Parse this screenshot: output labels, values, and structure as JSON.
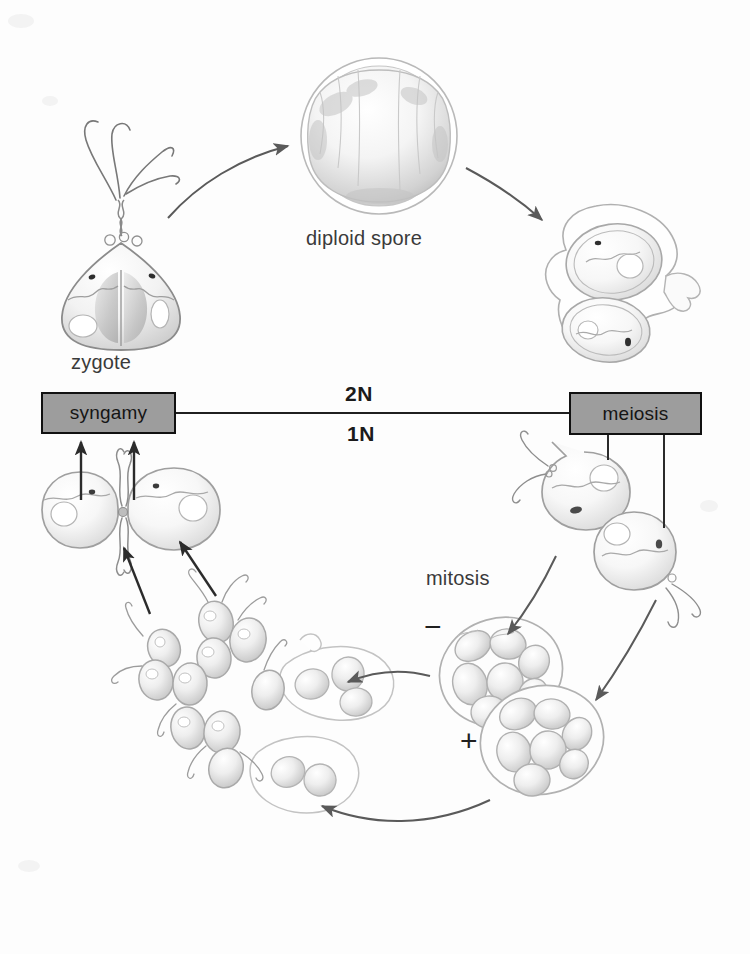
{
  "figure": {
    "background_color": "#fdfdfd",
    "box_fill_color": "#9d9d9d",
    "box_border_color": "#111111",
    "ink_color": "#555555",
    "text_color": "#3a3a3a"
  },
  "nodes": {
    "syngamy": {
      "label": "syngamy"
    },
    "meiosis": {
      "label": "meiosis"
    }
  },
  "labels": {
    "zygote": "zygote",
    "diploid_spore": "diploid spore",
    "mitosis": "mitosis",
    "ploidy_diploid": "2N",
    "ploidy_haploid": "1N",
    "mating_type_minus": "−",
    "mating_type_plus": "+"
  },
  "stages": [
    {
      "id": "zygote",
      "label": "zygote",
      "description": "fused diploid zygote with paired flagella and two nuclei"
    },
    {
      "id": "diploid-spore",
      "label": "diploid spore",
      "description": "round thick-walled diploid spore"
    },
    {
      "id": "meiosis",
      "label": "meiosis",
      "description": "meiotic division producing haploid cells"
    },
    {
      "id": "haploid-cells",
      "label": "",
      "description": "two flagellated haploid cells"
    },
    {
      "id": "mitosis",
      "label": "mitosis",
      "description": "mitotic division producing daughter cells inside parent wall"
    },
    {
      "id": "minus-cluster",
      "label": "−",
      "description": "minus mating-type cell packet"
    },
    {
      "id": "plus-cluster",
      "label": "+",
      "description": "plus mating-type cell packet"
    },
    {
      "id": "released-gametes",
      "label": "",
      "description": "released flagellated gametes escaping from ruptured cells"
    },
    {
      "id": "syngamy",
      "label": "syngamy",
      "description": "fusion of plus and minus gametes"
    }
  ]
}
